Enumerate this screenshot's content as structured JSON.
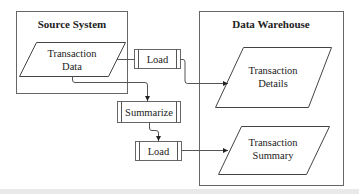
{
  "diagram": {
    "containers": [
      {
        "id": "source",
        "title": "Source System"
      },
      {
        "id": "warehouse",
        "title": "Data Warehouse"
      }
    ],
    "data_stores": [
      {
        "id": "transaction-data",
        "lines": [
          "Transaction",
          "Data"
        ]
      },
      {
        "id": "transaction-details",
        "lines": [
          "Transaction",
          "Details"
        ]
      },
      {
        "id": "transaction-summary",
        "lines": [
          "Transaction",
          "Summary"
        ]
      }
    ],
    "processes": [
      {
        "id": "load-1",
        "label": "Load"
      },
      {
        "id": "summarize",
        "label": "Summarize"
      },
      {
        "id": "load-2",
        "label": "Load"
      }
    ],
    "edges": [
      {
        "from": "transaction-data",
        "to": "load-1"
      },
      {
        "from": "load-1",
        "to": "transaction-details"
      },
      {
        "from": "transaction-data",
        "to": "summarize"
      },
      {
        "from": "summarize",
        "to": "load-2"
      },
      {
        "from": "load-2",
        "to": "transaction-summary"
      }
    ]
  }
}
